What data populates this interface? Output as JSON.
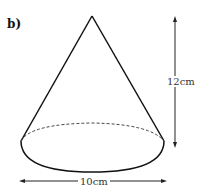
{
  "part_label": "b)",
  "height_label": "12cm",
  "diameter_label": "10cm",
  "shape": "cone"
}
